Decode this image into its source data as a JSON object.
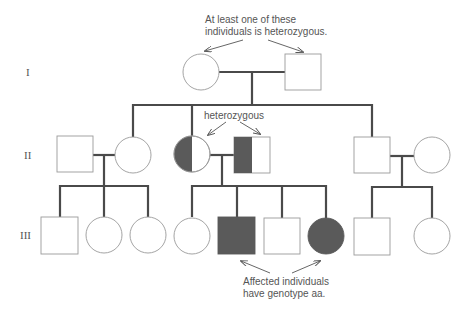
{
  "diagram": {
    "type": "pedigree",
    "generations": [
      "I",
      "II",
      "III"
    ],
    "annotations": {
      "top_line1": "At least one of these",
      "top_line2": "individuals is heterozygous.",
      "middle": "heterozygous",
      "bottom_line1": "Affected individuals",
      "bottom_line2": "have genotype aa."
    },
    "colors": {
      "line": "#4a4a4a",
      "affected": "#5a5a5a",
      "outline": "#9a9a9a",
      "text": "#555555"
    },
    "individuals": [
      {
        "id": "I-1",
        "generation": "I",
        "sex": "female",
        "status": "unaffected"
      },
      {
        "id": "I-2",
        "generation": "I",
        "sex": "male",
        "status": "unaffected"
      },
      {
        "id": "II-1",
        "generation": "II",
        "sex": "male",
        "status": "unaffected"
      },
      {
        "id": "II-2",
        "generation": "II",
        "sex": "female",
        "status": "unaffected"
      },
      {
        "id": "II-3",
        "generation": "II",
        "sex": "female",
        "status": "heterozygous carrier"
      },
      {
        "id": "II-4",
        "generation": "II",
        "sex": "male",
        "status": "heterozygous carrier"
      },
      {
        "id": "II-5",
        "generation": "II",
        "sex": "male",
        "status": "unaffected"
      },
      {
        "id": "II-6",
        "generation": "II",
        "sex": "female",
        "status": "unaffected"
      },
      {
        "id": "III-1",
        "generation": "III",
        "sex": "male",
        "status": "unaffected"
      },
      {
        "id": "III-2",
        "generation": "III",
        "sex": "female",
        "status": "unaffected"
      },
      {
        "id": "III-3",
        "generation": "III",
        "sex": "female",
        "status": "unaffected"
      },
      {
        "id": "III-4",
        "generation": "III",
        "sex": "female",
        "status": "unaffected"
      },
      {
        "id": "III-5",
        "generation": "III",
        "sex": "male",
        "status": "affected"
      },
      {
        "id": "III-6",
        "generation": "III",
        "sex": "male",
        "status": "unaffected"
      },
      {
        "id": "III-7",
        "generation": "III",
        "sex": "female",
        "status": "affected"
      },
      {
        "id": "III-8",
        "generation": "III",
        "sex": "male",
        "status": "unaffected"
      },
      {
        "id": "III-9",
        "generation": "III",
        "sex": "female",
        "status": "unaffected"
      }
    ]
  }
}
